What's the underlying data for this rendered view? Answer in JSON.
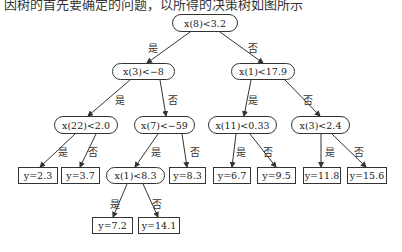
{
  "caption_fragment": "因树的首先要确定的问题，以所得的决策树如图所示",
  "edge_labels": {
    "yes": "是",
    "no": "否"
  },
  "nodes": {
    "root": "x(8)<3.2",
    "n_l": "x(3)<−8",
    "n_r": "x(1)<17.9",
    "n_ll": "x(22)<2.0",
    "n_lr": "x(7)<−59",
    "n_rl": "x(11)<0.33",
    "n_rr": "x(3)<2.4",
    "n_lrl": "x(1)<8.3"
  },
  "leaves": {
    "l1": "y=2.3",
    "l2": "y=3.7",
    "l3": "y=8.3",
    "l4": "y=6.7",
    "l5": "y=9.5",
    "l6": "y=11.8",
    "l7": "y=15.6",
    "l8": "y=7.2",
    "l9": "y=14.1"
  }
}
